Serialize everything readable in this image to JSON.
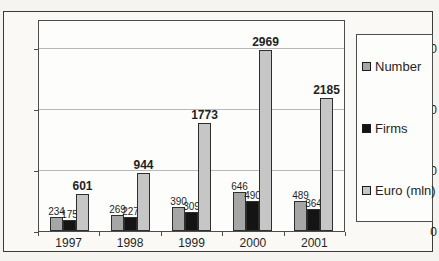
{
  "chart_data": {
    "type": "bar",
    "title": "",
    "xlabel": "",
    "ylabel": "",
    "categories": [
      "1997",
      "1998",
      "1999",
      "2000",
      "2001"
    ],
    "series": [
      {
        "name": "Number",
        "color": "#a6a6a6",
        "label_weight": "normal",
        "values": [
          234,
          269,
          390,
          646,
          489
        ]
      },
      {
        "name": "Firms",
        "color": "#141414",
        "label_weight": "normal",
        "values": [
          175,
          227,
          309,
          490,
          364
        ]
      },
      {
        "name": "Euro (mln)",
        "color": "#c6c6c6",
        "label_weight": "bold",
        "values": [
          601,
          944,
          1773,
          2969,
          2185
        ]
      }
    ],
    "yticks": [
      0,
      1000,
      2000,
      3000
    ],
    "ylim": [
      0,
      3475
    ],
    "grid": true,
    "bar_labels": true,
    "legend_position": "right"
  },
  "colors": {
    "figure_background": "#f5f4f0",
    "plot_background": "#fdfdfb",
    "outer_border": "#3b3b3b",
    "axis": "#4d4d4d",
    "gridline": "#b8b8b8",
    "text": "#1f1f1f",
    "bar_border": "#2e2e2e"
  }
}
